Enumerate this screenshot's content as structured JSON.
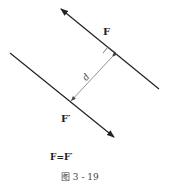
{
  "diagram": {
    "force_top_label": "F",
    "force_bottom_label": "F′",
    "distance_label": "d",
    "equation": "F=F′",
    "caption": "图 3 - 19"
  }
}
